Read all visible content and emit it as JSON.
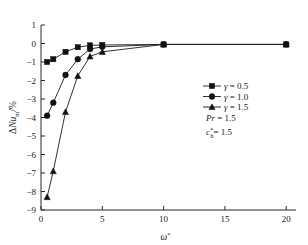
{
  "chart_data": {
    "type": "line",
    "title": "",
    "xlabel": "ω*",
    "ylabel": "ΔNu_m/%",
    "xlim": [
      0,
      20.8
    ],
    "ylim": [
      -9,
      1
    ],
    "xticks": [
      "0",
      "5",
      "10",
      "15",
      "20"
    ],
    "xtick_values": [
      0,
      5,
      10,
      15,
      20
    ],
    "yticks": [
      "1",
      "0",
      "−1",
      "−2",
      "−3",
      "−4",
      "−5",
      "−6",
      "−7",
      "−8",
      "−9"
    ],
    "ytick_values": [
      1,
      0,
      -1,
      -2,
      -3,
      -4,
      -5,
      -6,
      -7,
      -8,
      -9
    ],
    "grid": false,
    "legend_position": "right-center",
    "series": [
      {
        "name": "γ = 0.5",
        "marker": "square",
        "x": [
          0.5,
          1,
          2,
          3,
          4,
          5,
          10,
          20
        ],
        "values": [
          -1.0,
          -0.85,
          -0.45,
          -0.2,
          -0.1,
          -0.08,
          -0.05,
          -0.05
        ]
      },
      {
        "name": "γ = 1.0",
        "marker": "circle",
        "x": [
          0.5,
          1,
          2,
          3,
          4,
          5,
          10,
          20
        ],
        "values": [
          -3.9,
          -3.2,
          -1.7,
          -0.85,
          -0.3,
          -0.18,
          -0.05,
          -0.05
        ]
      },
      {
        "name": "γ = 1.5",
        "marker": "triangle",
        "x": [
          0.5,
          1,
          2,
          3,
          4,
          5,
          10,
          20
        ],
        "values": [
          -8.3,
          -6.9,
          -3.7,
          -1.75,
          -0.7,
          -0.45,
          -0.05,
          -0.05
        ]
      }
    ],
    "annotations": [
      {
        "text": "Pr = 1.5"
      },
      {
        "text": "c*h = 1.5"
      }
    ]
  },
  "legend": {
    "items": [
      {
        "label": "γ = 0.5",
        "marker": "square-marker-icon"
      },
      {
        "label": "γ = 1.0",
        "marker": "circle-marker-icon"
      },
      {
        "label": "γ = 1.5",
        "marker": "triangle-marker-icon"
      }
    ],
    "param_pr_symbol": "Pr",
    "param_pr_value": "= 1.5",
    "param_c_symbol": "c",
    "param_c_sub": "h",
    "param_c_sup": "*",
    "param_c_value": "= 1.5"
  },
  "axes": {
    "x_symbol": "ω",
    "x_sup": "*",
    "y_delta": "Δ",
    "y_nu": "Nu",
    "y_sub": "m",
    "y_unit": "/%"
  },
  "colors": {
    "line": "#1d1d1d",
    "marker": "#111111",
    "axis": "#2b2b2b",
    "background": "#ffffff"
  }
}
